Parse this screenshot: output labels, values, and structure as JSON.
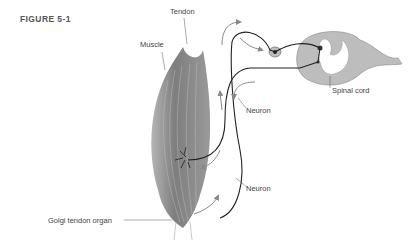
{
  "figure": {
    "title": "FIGURE 5-1",
    "labels": {
      "tendon": "Tendon",
      "muscle": "Muscle",
      "spinal_cord": "Spinal cord",
      "neuron_upper": "Neuron",
      "neuron_lower": "Neuron",
      "golgi": "Golgi tendon organ"
    },
    "colors": {
      "muscle": "#8a8a8a",
      "spinal_cord_gray": "#b9b9b9",
      "spinal_cord_white": "#ffffff",
      "neuron": "#222222",
      "arrow": "#888888",
      "text": "#444444"
    }
  }
}
